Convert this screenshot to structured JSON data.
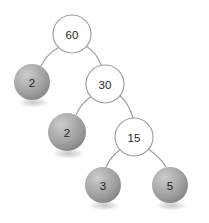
{
  "diagram": {
    "type": "binary-tree",
    "background_color": "#ffffff",
    "edge_color": "#9b9b9b",
    "open_node_fill": "#ffffff",
    "open_node_stroke": "#9b9b9b",
    "filled_node_light": "#c0c0c0",
    "filled_node_mid": "#a3a3a3",
    "filled_node_dark": "#828282",
    "label_color": "#1f1f1f"
  },
  "nodes": [
    {
      "id": "n60",
      "label": "60",
      "style": "open",
      "cx": 72,
      "cy": 34,
      "r": 19
    },
    {
      "id": "n2a",
      "label": "2",
      "style": "filled",
      "cx": 32,
      "cy": 82,
      "r": 18
    },
    {
      "id": "n30",
      "label": "30",
      "style": "open",
      "cx": 105,
      "cy": 84,
      "r": 19
    },
    {
      "id": "n2b",
      "label": "2",
      "style": "filled",
      "cx": 67,
      "cy": 132,
      "r": 19
    },
    {
      "id": "n15",
      "label": "15",
      "style": "open",
      "cx": 134,
      "cy": 137,
      "r": 19
    },
    {
      "id": "n3",
      "label": "3",
      "style": "filled",
      "cx": 103,
      "cy": 185,
      "r": 18
    },
    {
      "id": "n5",
      "label": "5",
      "style": "filled",
      "cx": 170,
      "cy": 185,
      "r": 18
    }
  ],
  "edges": [
    {
      "id": "e-60-2a",
      "from": "n60",
      "to": "n2a",
      "path": "M 58.5 47.5 Q 47 54 41 66"
    },
    {
      "id": "e-60-30",
      "from": "n60",
      "to": "n30",
      "path": "M 86 46 Q 97 53 101 65"
    },
    {
      "id": "e-30-2b",
      "from": "n30",
      "to": "n2b",
      "path": "M 92 96 Q 81 103 76 115"
    },
    {
      "id": "e-30-15",
      "from": "n30",
      "to": "n15",
      "path": "M 119 95 Q 129 103 133 118"
    },
    {
      "id": "e-15-3",
      "from": "n15",
      "to": "n3",
      "path": "M 121 149 Q 111 156 106 167"
    },
    {
      "id": "e-15-5",
      "from": "n15",
      "to": "n5",
      "path": "M 148 149 Q 160 157 166 167"
    }
  ]
}
